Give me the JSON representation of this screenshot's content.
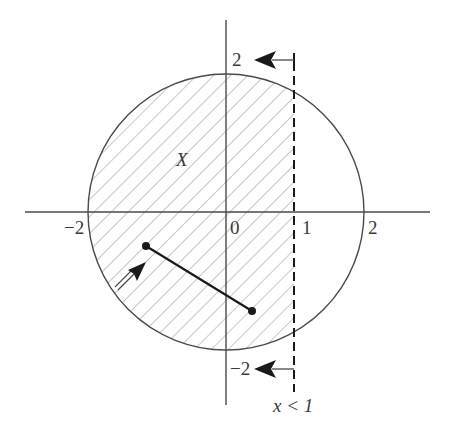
{
  "diagram": {
    "region_label": "X",
    "constraint_label": "x < 1",
    "axes": {
      "x_ticks": [
        {
          "value": -2,
          "label": "−2"
        },
        {
          "value": 0,
          "label": "0"
        },
        {
          "value": 1,
          "label": "1"
        },
        {
          "value": 2,
          "label": "2"
        }
      ],
      "y_ticks": [
        {
          "value": 2,
          "label": "2"
        },
        {
          "value": -2,
          "label": "−2"
        }
      ]
    },
    "circle": {
      "center": [
        0,
        0
      ],
      "radius": 2
    },
    "boundary_line": {
      "x": 1,
      "style": "dashed"
    },
    "segment": {
      "from": [
        -1.15,
        -0.5
      ],
      "to": [
        0.4,
        -1.4
      ]
    },
    "colors": {
      "stroke": "#4a4a4a",
      "hatch": "#9a9a9a",
      "arrow": "#1a1a1a",
      "background": "#ffffff"
    }
  },
  "labels": {
    "x_neg2": "−2",
    "x_0": "0",
    "x_1": "1",
    "x_2": "2",
    "y_2": "2",
    "y_neg2": "−2",
    "region": "X",
    "constraint": "x < 1"
  }
}
